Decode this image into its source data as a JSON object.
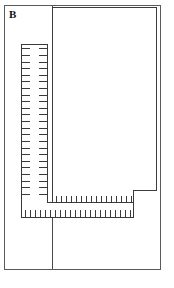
{
  "figure": {
    "panel_label": "B",
    "background_color": "#ffffff",
    "line_color": "#3a3a3a",
    "frame_color": "#5a5a5a",
    "width": 174,
    "height": 288
  },
  "outer_frame": {
    "name": "outer-frame",
    "x": 4,
    "y": 5,
    "width": 157,
    "height": 265
  },
  "divider": {
    "name": "vertical-divider-line",
    "x": 52,
    "y": 6,
    "height": 263
  },
  "blocks": [
    {
      "name": "large-upper-rectangle",
      "x": 52,
      "y": 7,
      "width": 105,
      "height": 184
    }
  ],
  "rulers": {
    "vertical": {
      "name": "vertical-ruler",
      "x": 21,
      "y": 44,
      "width": 27,
      "height": 174,
      "tick_count": 26,
      "tick_side": "both",
      "tick_length": 8
    },
    "horizontal_lower": {
      "name": "horizontal-ruler-lower",
      "x": 21,
      "y": 202,
      "width": 113,
      "height": 16,
      "tick_count": 22,
      "tick_side": "bottom",
      "tick_length": 7
    },
    "horizontal_upper": {
      "name": "horizontal-ruler-upper",
      "x": 52,
      "y": 190,
      "width": 82,
      "height": 13,
      "tick_count": 16,
      "tick_side": "bottom",
      "tick_length": 7
    }
  }
}
